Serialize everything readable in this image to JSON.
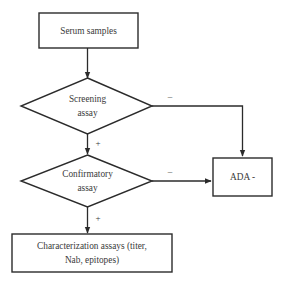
{
  "figure": {
    "type": "flowchart",
    "background_color": "#ffffff",
    "line_color": "#2b2b2b",
    "text_color": "#3a3a3a"
  },
  "nodes": {
    "serum_samples": {
      "shape": "rectangle",
      "label": "Serum samples"
    },
    "screening_assay": {
      "shape": "diamond",
      "label_line1": "Screening",
      "label_line2": "assay"
    },
    "confirmatory_assay": {
      "shape": "diamond",
      "label_line1": "Confirmatory",
      "label_line2": "assay"
    },
    "ada_negative": {
      "shape": "rectangle",
      "label": "ADA -"
    },
    "characterization_assays": {
      "shape": "rectangle",
      "label_line1": "Characterization assays (titer,",
      "label_line2": "Nab, epitopes)"
    }
  },
  "edges": {
    "serum_to_screening": {
      "label": ""
    },
    "screening_negative": {
      "label": "–"
    },
    "screening_positive": {
      "label": "+"
    },
    "confirmatory_negative": {
      "label": "–"
    },
    "confirmatory_positive": {
      "label": "+"
    }
  }
}
